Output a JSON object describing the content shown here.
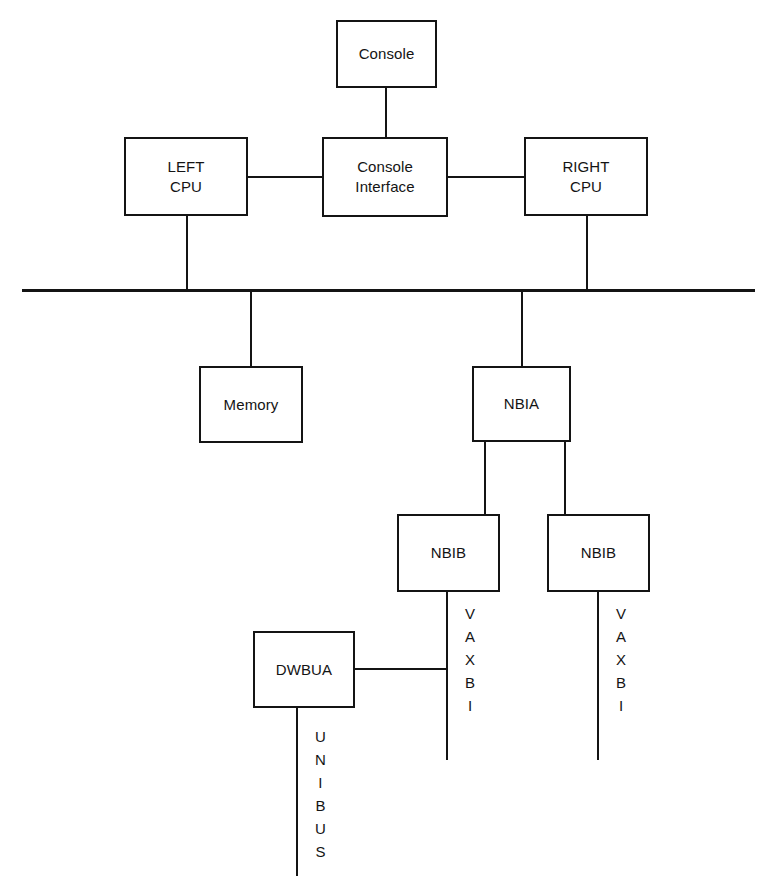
{
  "diagram": {
    "line_color": "#141414",
    "background": "#ffffff",
    "nodes": [
      {
        "id": "console",
        "label": "Console",
        "x": 336,
        "y": 20,
        "w": 101,
        "h": 68
      },
      {
        "id": "left-cpu",
        "label": "LEFT\nCPU",
        "x": 124,
        "y": 137,
        "w": 124,
        "h": 79
      },
      {
        "id": "console-interface",
        "label": "Console\nInterface",
        "x": 322,
        "y": 137,
        "w": 126,
        "h": 80
      },
      {
        "id": "right-cpu",
        "label": "RIGHT\nCPU",
        "x": 524,
        "y": 137,
        "w": 124,
        "h": 79
      },
      {
        "id": "memory",
        "label": "Memory",
        "x": 199,
        "y": 366,
        "w": 104,
        "h": 77
      },
      {
        "id": "nbia",
        "label": "NBIA",
        "x": 472,
        "y": 366,
        "w": 99,
        "h": 76
      },
      {
        "id": "nbib-left",
        "label": "NBIB",
        "x": 397,
        "y": 514,
        "w": 103,
        "h": 78
      },
      {
        "id": "nbib-right",
        "label": "NBIB",
        "x": 547,
        "y": 514,
        "w": 103,
        "h": 78
      },
      {
        "id": "dwbua",
        "label": "DWBUA",
        "x": 253,
        "y": 631,
        "w": 102,
        "h": 77
      }
    ],
    "bus_labels": [
      {
        "id": "vaxbi-left",
        "text": "VAXBI",
        "x": 465,
        "y": 602
      },
      {
        "id": "vaxbi-right",
        "text": "VAXBI",
        "x": 616,
        "y": 602
      },
      {
        "id": "unibus",
        "text": "UNIBUS",
        "x": 315,
        "y": 725
      }
    ],
    "connections": [
      {
        "id": "console-to-console-interface",
        "type": "vertical",
        "x": 386,
        "y1": 88,
        "y2": 137
      },
      {
        "id": "left-cpu-to-console-interface",
        "type": "horizontal",
        "y": 177,
        "x1": 248,
        "x2": 322
      },
      {
        "id": "console-interface-to-right-cpu",
        "type": "horizontal",
        "y": 177,
        "x1": 448,
        "x2": 524
      },
      {
        "id": "left-cpu-to-bus",
        "type": "vertical",
        "x": 187,
        "y1": 216,
        "y2": 290
      },
      {
        "id": "right-cpu-to-bus",
        "type": "vertical",
        "x": 587,
        "y1": 216,
        "y2": 290
      },
      {
        "id": "system-bus",
        "type": "horizontal",
        "y": 290,
        "x1": 22,
        "x2": 755
      },
      {
        "id": "bus-to-memory",
        "type": "vertical",
        "x": 251,
        "y1": 290,
        "y2": 366
      },
      {
        "id": "bus-to-nbia",
        "type": "vertical",
        "x": 522,
        "y1": 290,
        "y2": 366
      },
      {
        "id": "nbia-to-nbib-left",
        "type": "vertical",
        "x": 485,
        "y1": 442,
        "y2": 514
      },
      {
        "id": "nbia-to-nbib-right",
        "type": "vertical",
        "x": 565,
        "y1": 442,
        "y2": 514
      },
      {
        "id": "vaxbi-left-line",
        "type": "vertical",
        "x": 447,
        "y1": 592,
        "y2": 760
      },
      {
        "id": "vaxbi-right-line",
        "type": "vertical",
        "x": 598,
        "y1": 592,
        "y2": 760
      },
      {
        "id": "dwbua-to-vaxbi-left",
        "type": "horizontal",
        "y": 669,
        "x1": 355,
        "x2": 447
      },
      {
        "id": "unibus-line",
        "type": "vertical",
        "x": 297,
        "y1": 708,
        "y2": 876
      }
    ]
  }
}
